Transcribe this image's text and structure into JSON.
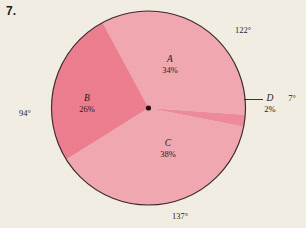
{
  "problem": {
    "number": "7."
  },
  "chart_data": {
    "type": "pie",
    "title": "",
    "center": {
      "x": 148.5,
      "y": 108
    },
    "radius": 97,
    "categories": [
      "A",
      "B",
      "C",
      "D"
    ],
    "values": [
      34,
      26,
      38,
      2
    ],
    "value_unit": "%",
    "labels": [
      {
        "name": "A",
        "percent": "34%",
        "angle": "122°",
        "color": "#f2a9b2",
        "label_x": 170,
        "label_y": 58
      },
      {
        "name": "B",
        "percent": "26%",
        "angle": "94°",
        "color": "#ed7f90",
        "label_x": 86,
        "label_y": 101
      },
      {
        "name": "C",
        "percent": "38%",
        "angle": "137°",
        "color": "#f2a9b2",
        "label_x": 168,
        "label_y": 140
      },
      {
        "name": "D",
        "percent": "2%",
        "angle": "7°",
        "color": "#ef8c9b",
        "label_x": 270,
        "label_y": 100
      }
    ],
    "angle_annotations": [
      {
        "id": "angle-top-right",
        "text": "122°",
        "x": 243,
        "y": 33
      },
      {
        "id": "angle-right",
        "text": "7°",
        "x": 292,
        "y": 100
      },
      {
        "id": "angle-left",
        "text": "94°",
        "x": 24,
        "y": 114
      },
      {
        "id": "angle-bottom",
        "text": "137°",
        "x": 178,
        "y": 216
      }
    ],
    "colors": {
      "light_sector": "#f2a9b2",
      "dark_sector": "#ed7f90",
      "outline": "#3a2a2e",
      "background": "#f3efe4",
      "text": "#2a1a1e"
    },
    "leader_line": {
      "from_x": 246,
      "from_y": 99,
      "to_x": 262,
      "to_y": 99
    },
    "center_dot": true,
    "grid": false,
    "legend": "none"
  }
}
